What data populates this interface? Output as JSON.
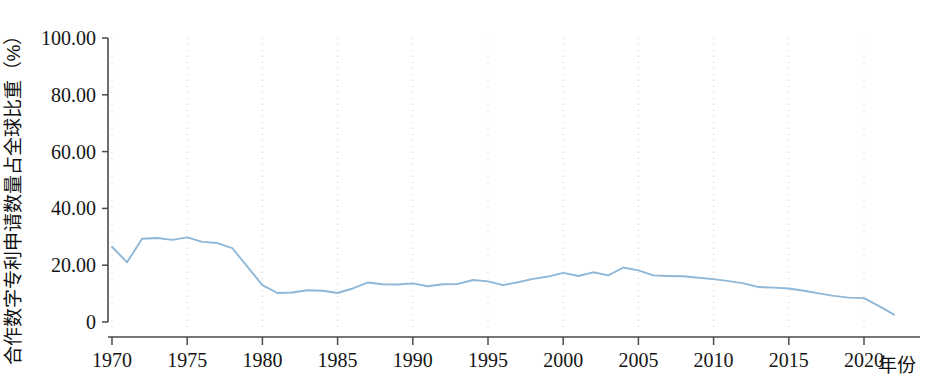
{
  "chart_data": {
    "type": "line",
    "title": "",
    "xlabel": "年份",
    "ylabel": "合作数字专利申请数量占全球比重（%）",
    "xlim": [
      1969,
      2023
    ],
    "ylim": [
      0,
      100
    ],
    "grid": true,
    "legend": "none",
    "line_color": "#8fb8d8",
    "axis_color": "#4a4a4a",
    "grid_color": "#d8c9c9",
    "y_ticks": [
      "0",
      "20.00",
      "40.00",
      "60.00",
      "80.00",
      "100.00"
    ],
    "y_tick_values": [
      0,
      20,
      40,
      60,
      80,
      100
    ],
    "x_ticks": [
      "1970",
      "1975",
      "1980",
      "1985",
      "1990",
      "1995",
      "2000",
      "2005",
      "2010",
      "2015",
      "2020"
    ],
    "x_tick_values": [
      1970,
      1975,
      1980,
      1985,
      1990,
      1995,
      2000,
      2005,
      2010,
      2015,
      2020
    ],
    "series": [
      {
        "name": "合作数字专利申请数量占全球比重",
        "x": [
          1970,
          1971,
          1972,
          1973,
          1974,
          1975,
          1976,
          1977,
          1978,
          1979,
          1980,
          1981,
          1982,
          1983,
          1984,
          1985,
          1986,
          1987,
          1988,
          1989,
          1990,
          1991,
          1992,
          1993,
          1994,
          1995,
          1996,
          1997,
          1998,
          1999,
          2000,
          2001,
          2002,
          2003,
          2004,
          2005,
          2006,
          2007,
          2008,
          2009,
          2010,
          2011,
          2012,
          2013,
          2014,
          2015,
          2016,
          2017,
          2018,
          2019,
          2020,
          2021,
          2022
        ],
        "values": [
          26.5,
          21.0,
          29.3,
          29.6,
          28.9,
          29.8,
          28.2,
          27.8,
          26.0,
          19.5,
          13.0,
          10.2,
          10.4,
          11.2,
          11.0,
          10.2,
          11.8,
          13.9,
          13.3,
          13.2,
          13.6,
          12.6,
          13.3,
          13.4,
          14.8,
          14.3,
          13.0,
          14.0,
          15.2,
          16.0,
          17.3,
          16.2,
          17.5,
          16.4,
          19.2,
          18.2,
          16.4,
          16.2,
          16.1,
          15.6,
          15.1,
          14.4,
          13.6,
          12.3,
          12.1,
          11.8,
          11.0,
          10.1,
          9.2,
          8.6,
          8.4,
          5.6,
          2.6
        ]
      }
    ]
  },
  "axis_titles": {
    "y_title": "合作数字专利申请数量占全球比重（%）",
    "x_title": "年份"
  }
}
